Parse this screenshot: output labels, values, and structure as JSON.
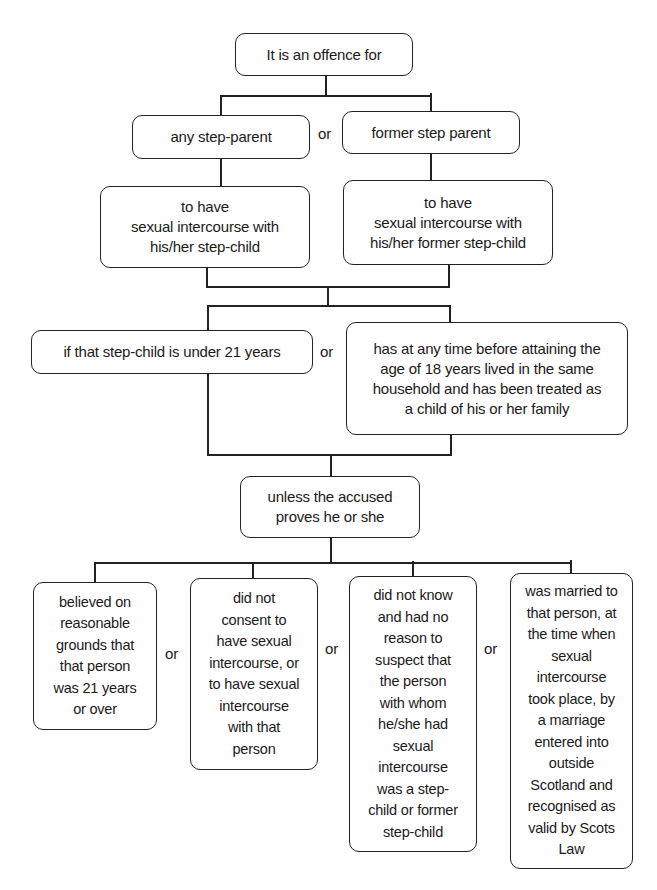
{
  "diagram": {
    "root": "It is an offence for",
    "who": {
      "left": "any step-parent",
      "right": "former step parent",
      "connector": "or"
    },
    "act": {
      "left": "to have\nsexual intercourse with\nhis/her step-child",
      "right": "to have\nsexual intercourse with\nhis/her former step-child"
    },
    "condition": {
      "left": "if that step-child is under 21 years",
      "right": "has at any time before attaining the\nage of 18 years lived in the same\nhousehold and has been treated as\na child of his or her family",
      "connector": "or"
    },
    "unless": "unless the accused\nproves he or she",
    "defences": [
      {
        "text": "believed on\nreasonable\ngrounds that\nthat person\nwas 21 years\nor over"
      },
      {
        "text": "did not\nconsent to\nhave sexual\nintercourse, or\nto have sexual\nintercourse\nwith that\nperson"
      },
      {
        "text": "did not know\nand had no\nreason to\nsuspect that\nthe person\nwith whom\nhe/she had\nsexual\nintercourse\nwas a step-\nchild or former\nstep-child"
      },
      {
        "text": "was married to\nthat person, at\nthe time when\nsexual\nintercourse\ntook place, by\na marriage\nentered into\noutside\nScotland and\nrecognised as\nvalid by Scots\nLaw"
      }
    ],
    "defence_connector": "or"
  }
}
